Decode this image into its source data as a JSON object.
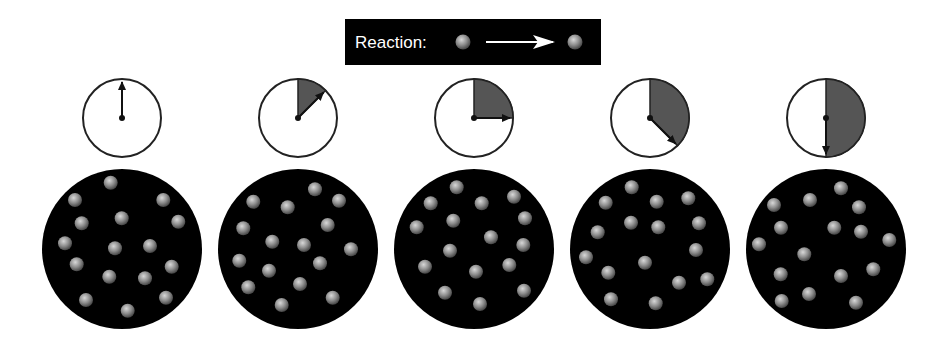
{
  "legend": {
    "label": "Reaction:",
    "reactant": "gray-sphere",
    "arrow": "right-arrow-icon",
    "product": "gray-sphere"
  },
  "colors": {
    "banner_bg": "#000000",
    "container_bg": "#000000",
    "clock_face": "#ffffff",
    "clock_fill": "#555555",
    "clock_stroke": "#222222",
    "sphere_light": "#cfcfcf",
    "sphere_mid": "#8a8a8a",
    "sphere_dark": "#4a4a4a"
  },
  "frames": [
    {
      "elapsed_fraction_of_clock": 0,
      "particle_count": 16,
      "particles": [
        [
          0.65,
          0.16
        ],
        [
          -0.4,
          0.5
        ],
        [
          0.3,
          0.32
        ],
        [
          -0.09,
          0.24
        ],
        [
          0.48,
          0.29
        ],
        [
          -0.09,
          0.21
        ],
        [
          -0.14,
          -0.06
        ],
        [
          -0.46,
          -0.05
        ],
        [
          0.28,
          0.16
        ],
        [
          0.47,
          0.32
        ],
        [
          -0.14,
          -0.17
        ],
        [
          -0.43,
          -0.11
        ],
        [
          0.29,
          -0.14
        ],
        [
          0.1,
          -0.29
        ],
        [
          -0.36,
          -0.47
        ],
        [
          -0.17,
          -0.34
        ]
      ]
    },
    {
      "elapsed_fraction_of_clock": 0.125,
      "particle_count": 16,
      "particles": []
    },
    {
      "elapsed_fraction_of_clock": 0.25,
      "particle_count": 16,
      "particles": []
    },
    {
      "elapsed_fraction_of_clock": 0.375,
      "particle_count": 16,
      "particles": []
    },
    {
      "elapsed_fraction_of_clock": 0.5,
      "particle_count": 16,
      "particles": []
    }
  ]
}
